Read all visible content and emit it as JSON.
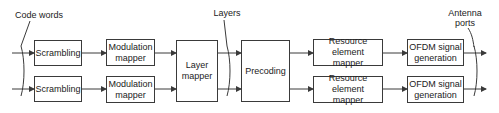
{
  "diagram": {
    "labels": {
      "code_words": "Code words",
      "layers": "Layers",
      "antenna_ports": "Antenna\nports"
    },
    "blocks": {
      "scrambling_1": "Scrambling",
      "scrambling_2": "Scrambling",
      "modulation_mapper_1": "Modulation\nmapper",
      "modulation_mapper_2": "Modulation\nmapper",
      "layer_mapper": "Layer\nmapper",
      "precoding": "Precoding",
      "resource_element_mapper_1": "Resource element\nmapper",
      "resource_element_mapper_2": "Resource element\nmapper",
      "ofdm_signal_generation_1": "OFDM signal\ngeneration",
      "ofdm_signal_generation_2": "OFDM signal\ngeneration"
    },
    "flow": [
      "Code words",
      "Scrambling",
      "Modulation mapper",
      "Layer mapper",
      "Layers",
      "Precoding",
      "Resource element mapper",
      "OFDM signal generation",
      "Antenna ports"
    ],
    "colors": {
      "line": "#3a3a3a",
      "text": "#222222",
      "background": "#ffffff"
    }
  }
}
